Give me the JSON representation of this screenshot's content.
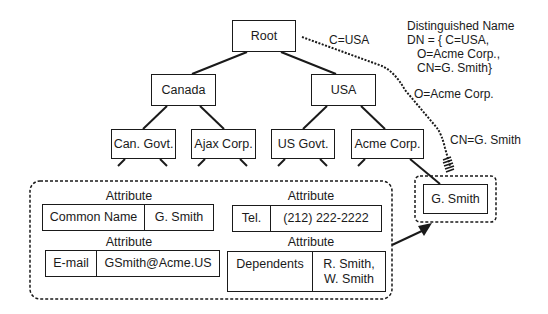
{
  "tree": {
    "root": "Root",
    "level1": [
      "Canada",
      "USA"
    ],
    "level2": [
      "Can. Govt.",
      "Ajax Corp.",
      "US Govt.",
      "Acme Corp."
    ],
    "leaf": "G. Smith"
  },
  "path_labels": {
    "c": "C=USA",
    "o": "O=Acme Corp.",
    "cn": "CN=G. Smith"
  },
  "distinguished_name": {
    "title": "Distinguished Name",
    "line1": "DN = { C=USA,",
    "line2": "O=Acme Corp.,",
    "line3": "CN=G. Smith}"
  },
  "attributes": [
    {
      "title": "Attribute",
      "name": "Common Name",
      "value": "G. Smith"
    },
    {
      "title": "Attribute",
      "name": "Tel.",
      "value": "(212) 222-2222"
    },
    {
      "title": "Attribute",
      "name": "E-mail",
      "value": "GSmith@Acme.US"
    },
    {
      "title": "Attribute",
      "name": "Dependents",
      "value_line1": "R. Smith,",
      "value_line2": "W. Smith"
    }
  ]
}
